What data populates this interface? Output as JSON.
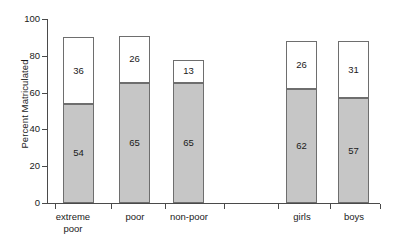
{
  "chart_data": {
    "type": "bar",
    "subtype": "stacked-vertical",
    "title": "",
    "xlabel": "",
    "ylabel": "Percent Matriculated",
    "ylim": [
      0,
      100
    ],
    "yticks": [
      0,
      20,
      40,
      60,
      80,
      100
    ],
    "ytick_labels": [
      "0",
      "20",
      "40",
      "60",
      "80",
      "100"
    ],
    "grid": false,
    "legend": "none",
    "categories": [
      "extreme\npoor",
      "poor",
      "non-poor",
      "girls",
      "boys"
    ],
    "category_labels": [
      "extreme poor",
      "poor",
      "non-poor",
      "girls",
      "boys"
    ],
    "series": [
      {
        "name": "lower segment",
        "color": "#c6c6c6",
        "values": [
          54,
          65,
          65,
          62,
          57
        ]
      },
      {
        "name": "upper segment",
        "color": "#ffffff",
        "values": [
          36,
          26,
          13,
          26,
          31
        ]
      }
    ],
    "bar_tops": [
      90,
      91,
      78,
      88,
      88
    ],
    "data_labels": {
      "lower": [
        "54",
        "65",
        "65",
        "62",
        "57"
      ],
      "upper": [
        "36",
        "26",
        "13",
        "26",
        "31"
      ]
    },
    "axis_color": "#4a4a4a",
    "bar_outline_color": "#6e6e6e",
    "text_color": "#1a1a1a",
    "background": "#ffffff"
  },
  "layout": {
    "bars": [
      {
        "left": 16,
        "width": 31,
        "tick": 8,
        "label_left": -10,
        "label_width": 72
      },
      {
        "left": 72,
        "width": 31,
        "tick": 64,
        "label_left": 52,
        "label_width": 72
      },
      {
        "left": 126,
        "width": 31,
        "tick": 118,
        "label_left": 103,
        "label_width": 78
      },
      {
        "left": 239,
        "width": 31,
        "tick": 231,
        "label_left": 219,
        "label_width": 72
      },
      {
        "left": 291,
        "width": 31,
        "tick": 283,
        "label_left": 271,
        "label_width": 72
      }
    ],
    "extra_ticks": [
      177,
      333
    ],
    "y_px_per_unit": 1.84,
    "baseline_y": 203,
    "top_y": 19
  }
}
